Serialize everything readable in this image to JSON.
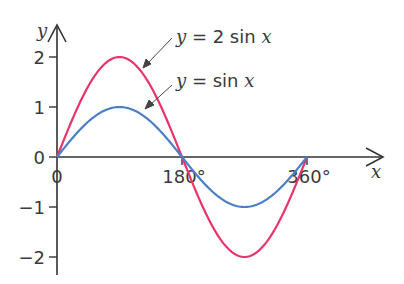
{
  "chart_data": {
    "type": "line",
    "title": "",
    "xlabel": "x",
    "ylabel": "y",
    "xlim": [
      0,
      360
    ],
    "ylim": [
      -2,
      2
    ],
    "x_ticks": [
      0,
      180,
      360
    ],
    "x_tick_labels": [
      "0",
      "180°",
      "360°"
    ],
    "y_ticks": [
      -2,
      -1,
      0,
      1,
      2
    ],
    "y_tick_labels": [
      "−2",
      "−1",
      "0",
      "1",
      "2"
    ],
    "grid": false,
    "series": [
      {
        "name": "y = 2 sin x",
        "color": "#e8336b",
        "x": [
          0,
          30,
          60,
          90,
          120,
          150,
          180,
          210,
          240,
          270,
          300,
          330,
          360
        ],
        "values": [
          0,
          1,
          1.732,
          2,
          1.732,
          1,
          0,
          -1,
          -1.732,
          -2,
          -1.732,
          -1,
          0
        ]
      },
      {
        "name": "y = sin x",
        "color": "#4a7fc8",
        "x": [
          0,
          30,
          60,
          90,
          120,
          150,
          180,
          210,
          240,
          270,
          300,
          330,
          360
        ],
        "values": [
          0,
          0.5,
          0.866,
          1,
          0.866,
          0.5,
          0,
          -0.5,
          -0.866,
          -1,
          -0.866,
          -0.5,
          0
        ]
      }
    ],
    "annotations": [
      {
        "text_parts": [
          "y",
          " = 2 sin ",
          "x"
        ],
        "target_series": "y = 2 sin x"
      },
      {
        "text_parts": [
          "y",
          " = sin ",
          "x"
        ],
        "target_series": "y = sin x"
      }
    ]
  }
}
